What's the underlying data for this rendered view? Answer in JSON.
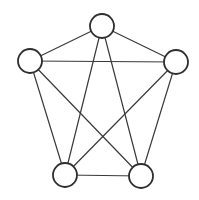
{
  "diagram": {
    "type": "complete-graph",
    "name": "K5",
    "colors": {
      "background": "#ffffff",
      "edge": "#3a3a3a",
      "node_stroke": "#2e2e2e",
      "node_fill": "#ffffff"
    },
    "node_radius": 12,
    "nodes": [
      {
        "id": "top",
        "x": 102,
        "y": 26
      },
      {
        "id": "left",
        "x": 30,
        "y": 61
      },
      {
        "id": "right",
        "x": 176,
        "y": 62
      },
      {
        "id": "bottom-left",
        "x": 65,
        "y": 175
      },
      {
        "id": "bottom-right",
        "x": 141,
        "y": 176
      }
    ],
    "edges": [
      [
        "top",
        "left"
      ],
      [
        "top",
        "right"
      ],
      [
        "top",
        "bottom-left"
      ],
      [
        "top",
        "bottom-right"
      ],
      [
        "left",
        "right"
      ],
      [
        "left",
        "bottom-left"
      ],
      [
        "left",
        "bottom-right"
      ],
      [
        "right",
        "bottom-left"
      ],
      [
        "right",
        "bottom-right"
      ],
      [
        "bottom-left",
        "bottom-right"
      ]
    ]
  }
}
